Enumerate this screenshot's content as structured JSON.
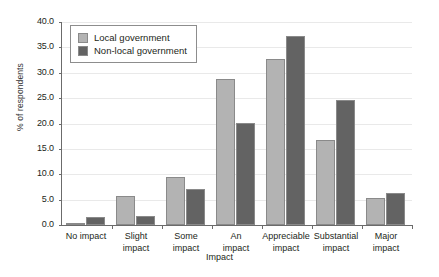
{
  "chart_data": {
    "type": "bar",
    "title": "",
    "xlabel": "Impact",
    "ylabel": "% of respondents",
    "categories": [
      "No impact",
      "Slight impact",
      "Some impact",
      "An impact",
      "Appreciable impact",
      "Substantial impact",
      "Major impact"
    ],
    "category_lines": [
      [
        "No impact"
      ],
      [
        "Slight",
        "impact"
      ],
      [
        "Some",
        "impact"
      ],
      [
        "An",
        "impact"
      ],
      [
        "Appreciable",
        "impact"
      ],
      [
        "Substantial",
        "impact"
      ],
      [
        "Major",
        "impact"
      ]
    ],
    "series": [
      {
        "name": "Local government",
        "color": "#b3b3b3",
        "values": [
          0.4,
          5.8,
          9.5,
          28.7,
          32.8,
          16.8,
          5.3
        ]
      },
      {
        "name": "Non-local government",
        "color": "#636363",
        "values": [
          1.5,
          1.8,
          7.0,
          20.1,
          37.3,
          24.7,
          6.4
        ]
      }
    ],
    "ylim": [
      0.0,
      40.0
    ],
    "ytick_labels": [
      "0.0",
      "5.0",
      "10.0",
      "15.0",
      "20.0",
      "25.0",
      "30.0",
      "35.0",
      "40.0"
    ],
    "ytick_values": [
      0,
      5,
      10,
      15,
      20,
      25,
      30,
      35,
      40
    ],
    "grid": true,
    "legend_position": "top-left"
  }
}
